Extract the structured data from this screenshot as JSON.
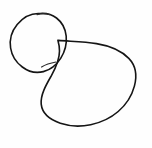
{
  "canvas": {
    "width": 152,
    "height": 148,
    "background_color": "#fefefe",
    "title": "",
    "description": "Hand-drawn sketch of two overlapping ellipses"
  },
  "style": {
    "stroke_color": "#151515",
    "stroke_width": 1.6,
    "fill": "none"
  },
  "shapes": [
    {
      "name": "small-ellipse",
      "label": "",
      "type": "ellipse",
      "center_x": 38,
      "center_y": 43,
      "radius_x": 29,
      "radius_y": 30,
      "rotation_deg": -28,
      "bounds": {
        "left": 10,
        "top": 13,
        "right": 67,
        "bottom": 73
      }
    },
    {
      "name": "large-ellipse",
      "label": "",
      "type": "ellipse",
      "center_x": 88,
      "center_y": 83,
      "radius_x": 47,
      "radius_y": 43,
      "rotation_deg": -4,
      "bounds": {
        "left": 41,
        "top": 40,
        "right": 135,
        "bottom": 126
      }
    }
  ]
}
